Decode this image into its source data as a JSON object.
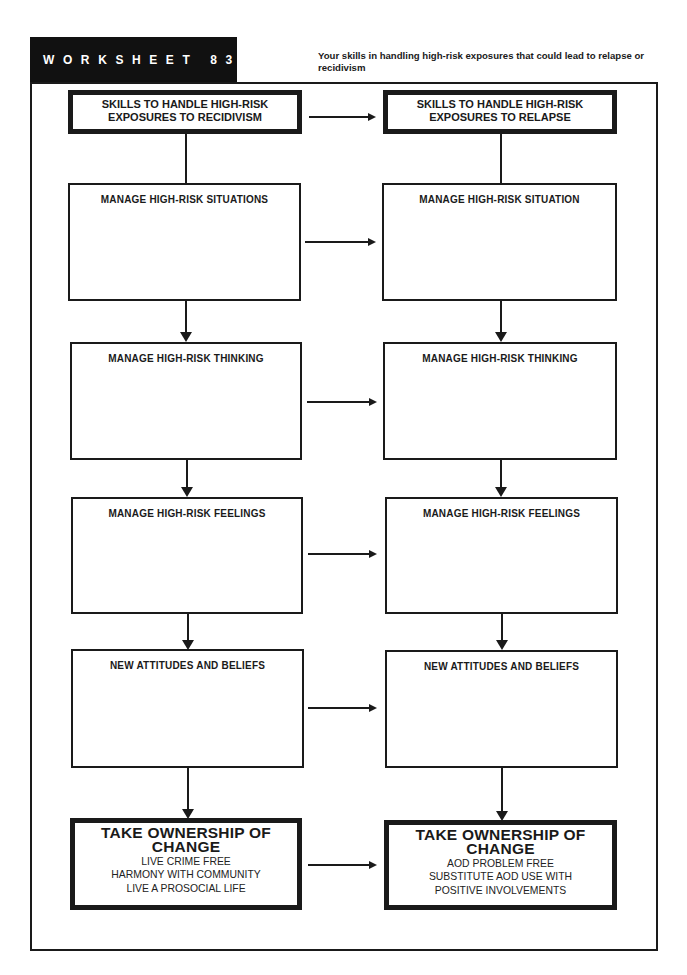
{
  "header": {
    "title": "WORKSHEET 83",
    "subtitle": "Your skills in handling high-risk exposures that could lead to relapse or recidivism"
  },
  "left_column": {
    "top": {
      "line1": "SKILLS TO HANDLE HIGH-RISK",
      "line2": "EXPOSURES TO RECIDIVISM"
    },
    "steps": [
      {
        "label": "MANAGE HIGH-RISK SITUATIONS"
      },
      {
        "label": "MANAGE HIGH-RISK THINKING"
      },
      {
        "label": "MANAGE HIGH-RISK FEELINGS"
      },
      {
        "label": "NEW ATTITUDES AND BELIEFS"
      }
    ],
    "outcome": {
      "title1": "TAKE OWNERSHIP OF",
      "title2": "CHANGE",
      "lines": [
        "LIVE CRIME FREE",
        "HARMONY WITH COMMUNITY",
        "LIVE A PROSOCIAL LIFE"
      ]
    }
  },
  "right_column": {
    "top": {
      "line1": "SKILLS TO HANDLE HIGH-RISK",
      "line2": "EXPOSURES TO RELAPSE"
    },
    "steps": [
      {
        "label": "MANAGE HIGH-RISK SITUATION"
      },
      {
        "label": "MANAGE HIGH-RISK THINKING"
      },
      {
        "label": "MANAGE HIGH-RISK FEELINGS"
      },
      {
        "label": "NEW ATTITUDES AND BELIEFS"
      }
    ],
    "outcome": {
      "title1": "TAKE OWNERSHIP OF",
      "title2": "CHANGE",
      "lines": [
        "AOD PROBLEM FREE",
        "SUBSTITUTE AOD USE WITH",
        "POSITIVE INVOLVEMENTS"
      ]
    }
  },
  "colors": {
    "ink": "#1a1a1a",
    "header_bg": "#111111",
    "paper": "#ffffff"
  }
}
